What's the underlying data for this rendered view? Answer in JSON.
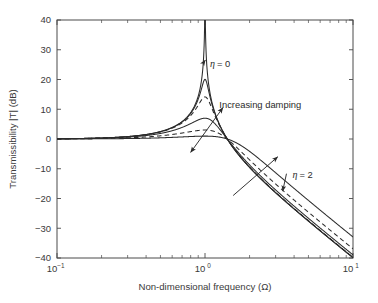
{
  "chart_data": {
    "type": "line",
    "title": "",
    "xlabel": "Non-dimensional frequency (Ω)",
    "ylabel": "Transmissibility |T| (dB)",
    "xscale": "log",
    "yscale": "linear",
    "xlim": [
      0.1,
      10
    ],
    "ylim": [
      -40,
      40
    ],
    "grid": false,
    "legend": "none",
    "xticks": [
      {
        "value": 0.1,
        "label": "10",
        "exponent": "-1"
      },
      {
        "value": 1,
        "label": "10",
        "exponent": "0"
      },
      {
        "value": 10,
        "label": "10",
        "exponent": "1"
      }
    ],
    "yticks": [
      40,
      30,
      20,
      10,
      0,
      -10,
      -20,
      -30,
      -40
    ],
    "series": [
      {
        "name": "η = 0",
        "loss_factor": 0,
        "style": "solid",
        "peak_db": 40,
        "peak_frequency": 1.0,
        "value_at_10": -40.0,
        "x": [
          0.1,
          0.2,
          0.3,
          0.4,
          0.5,
          0.6,
          0.7,
          0.8,
          0.85,
          0.9,
          0.93,
          0.95,
          0.97,
          0.98,
          0.99,
          1.0,
          1.01,
          1.02,
          1.03,
          1.05,
          1.07,
          1.1,
          1.15,
          1.2,
          1.3,
          1.4,
          1.6,
          2.0,
          2.5,
          3.0,
          4.0,
          5.0,
          7.0,
          10.0
        ],
        "y": [
          0.09,
          0.35,
          0.83,
          1.55,
          2.5,
          3.88,
          5.86,
          8.87,
          11.1,
          14.4,
          17.4,
          20.2,
          24.5,
          28.0,
          34.0,
          80.0,
          34.0,
          28.0,
          24.5,
          20.2,
          17.4,
          14.4,
          11.1,
          8.9,
          6.0,
          4.2,
          2.3,
          0.5,
          -0.8,
          -1.9,
          -3.8,
          -5.4,
          -8.0,
          -11.3
        ]
      },
      {
        "name": "η = 0.1",
        "loss_factor": 0.1,
        "style": "solid",
        "peak_db": 20.1,
        "peak_frequency": 1.0,
        "value_at_10": -39.6
      },
      {
        "name": "η = 0.2",
        "loss_factor": 0.2,
        "style": "dashed",
        "peak_db": 14.2,
        "peak_frequency": 1.0,
        "value_at_10": -38.8
      },
      {
        "name": "η = 0.5",
        "loss_factor": 0.5,
        "style": "solid",
        "peak_db": 6.8,
        "peak_frequency": 1.0,
        "value_at_10": -36.3
      },
      {
        "name": "η = 1",
        "loss_factor": 1,
        "style": "dashed",
        "peak_db": 3.0,
        "peak_frequency": 1.0,
        "value_at_10": -38.0
      },
      {
        "name": "η = 2",
        "loss_factor": 2,
        "style": "solid",
        "peak_db": 0.9,
        "peak_frequency": 1.0,
        "value_at_10": -33.0
      }
    ],
    "annotations": [
      {
        "id": "eta-zero",
        "text": "η = 0",
        "text_x": 1.08,
        "text_y": 25.5,
        "arrow_to_x": 1.005,
        "arrow_to_y": 26.5
      },
      {
        "id": "eta-two",
        "text": "η = 2",
        "text_x": 3.9,
        "text_y": -12.0,
        "arrow_to_x": 3.35,
        "arrow_to_y": -17.5
      },
      {
        "id": "increasing-damping",
        "text": "Increasing damping",
        "text_x": 1.25,
        "text_y": 11.5,
        "arrow_from_x": 1.32,
        "arrow_from_y": 10.5,
        "arrow_to_x": 0.8,
        "arrow_to_y": -4.5,
        "double_headed": true
      },
      {
        "id": "increasing-damping-hf",
        "arrow_from_x": 1.55,
        "arrow_from_y": -19.0,
        "arrow_to_x": 3.1,
        "arrow_to_y": -6.0,
        "double_headed": false
      }
    ],
    "colors": {
      "curve": "#2b2b2b",
      "axis": "#4a4a4a",
      "text": "#3a3a3a",
      "background": "#ffffff"
    }
  }
}
